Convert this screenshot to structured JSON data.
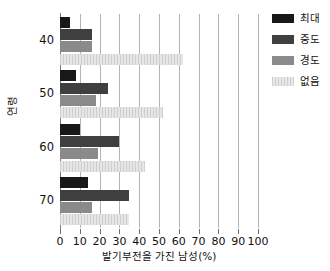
{
  "chart_data": {
    "type": "bar",
    "orientation": "horizontal",
    "title": "",
    "xlabel": "발기부전을 가진 남성(%)",
    "ylabel": "연령",
    "xlim": [
      0,
      100
    ],
    "xticks": [
      0,
      10,
      20,
      30,
      40,
      50,
      60,
      70,
      80,
      90,
      100
    ],
    "xtick_labels": [
      "0",
      "10",
      "20",
      "30",
      "40",
      "50",
      "60",
      "70",
      "80",
      "90",
      "100"
    ],
    "categories": [
      "40",
      "50",
      "60",
      "70"
    ],
    "ytick_labels": [
      "40",
      "50",
      "60",
      "70"
    ],
    "grid": "vertical",
    "legend_position": "right",
    "series": [
      {
        "name": "최대",
        "color": "#181818",
        "values": [
          5,
          8,
          10,
          14
        ]
      },
      {
        "name": "중도",
        "color": "#3f3f3f",
        "values": [
          16,
          24,
          30,
          35
        ]
      },
      {
        "name": "경도",
        "color": "#8a8a8a",
        "values": [
          16,
          18,
          19,
          16
        ]
      },
      {
        "name": "없음",
        "color": "#d8d8d8",
        "values": [
          62,
          52,
          43,
          35
        ]
      }
    ]
  },
  "legend": {
    "items": [
      {
        "label": "최대",
        "swatch": "s-max"
      },
      {
        "label": "중도",
        "swatch": "s-mod"
      },
      {
        "label": "경도",
        "swatch": "s-mild"
      },
      {
        "label": "없음",
        "swatch": "s-none"
      }
    ]
  },
  "axes": {
    "x_title": "발기부전을 가진 남성(%)",
    "y_title": "연령"
  }
}
